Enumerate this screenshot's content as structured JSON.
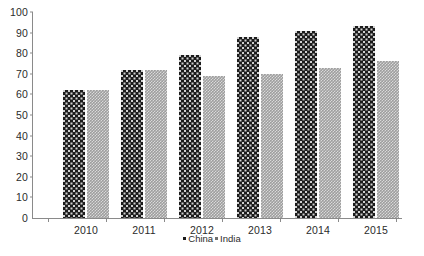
{
  "chart_data": {
    "type": "bar",
    "title": "",
    "subtitle": "",
    "xlabel": "",
    "ylabel": "",
    "categories": [
      "2010",
      "2011",
      "2012",
      "2013",
      "2014",
      "2015"
    ],
    "series": [
      {
        "name": "China",
        "color": "#1b1b1b",
        "values": [
          62,
          72,
          79,
          88,
          91,
          93
        ]
      },
      {
        "name": "India",
        "color": "#9e9e9e",
        "values": [
          62,
          72,
          69,
          70,
          73,
          76
        ]
      }
    ],
    "ylim": [
      0,
      100
    ],
    "yticks": [
      0,
      10,
      20,
      30,
      40,
      50,
      60,
      70,
      80,
      90,
      100
    ],
    "ytick_labels": [
      "0",
      "10",
      "20",
      "30",
      "40",
      "50",
      "60",
      "70",
      "80",
      "90",
      "100"
    ],
    "grid": false,
    "legend": {
      "position": "bottom-center",
      "entries": [
        {
          "label": "China",
          "marker": "square",
          "color": "#1b1b1b"
        },
        {
          "label": "India",
          "marker": "square",
          "color": "#6f6f6f"
        }
      ]
    },
    "axis_color": "#8a8a8a",
    "background": "#ffffff"
  }
}
